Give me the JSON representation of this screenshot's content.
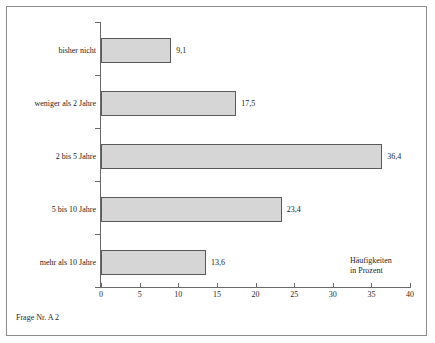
{
  "chart_data": {
    "type": "bar",
    "orientation": "horizontal",
    "title": "",
    "subtitle": "",
    "xlabel": "Häufigkeiten in Prozent",
    "ylabel": "",
    "categories": [
      "bisher nicht",
      "weniger als 2 Jahre",
      "2 bis 5 Jahre",
      "5 bis 10 Jahre",
      "mehr als 10 Jahre"
    ],
    "values": [
      9.1,
      17.5,
      36.4,
      23.4,
      13.6
    ],
    "value_labels": [
      "9,1",
      "17,5",
      "36,4",
      "23,4",
      "13,6"
    ],
    "xlim": [
      0,
      40
    ],
    "xticks": [
      0,
      5,
      10,
      15,
      20,
      25,
      30,
      35,
      40
    ],
    "xtick_labels": [
      "0",
      "5",
      "10",
      "15",
      "20",
      "25",
      "30",
      "35",
      "40"
    ],
    "grid": false,
    "legend": null,
    "bar_fill_color": "#d6d6d6",
    "bar_border_color": "#5a5a5a",
    "axis_color": "#6a6a6a"
  },
  "axis_caption": {
    "line1": "Häufigkeiten",
    "line2": "in Prozent"
  },
  "footer": {
    "note": "Frage Nr. A 2"
  }
}
